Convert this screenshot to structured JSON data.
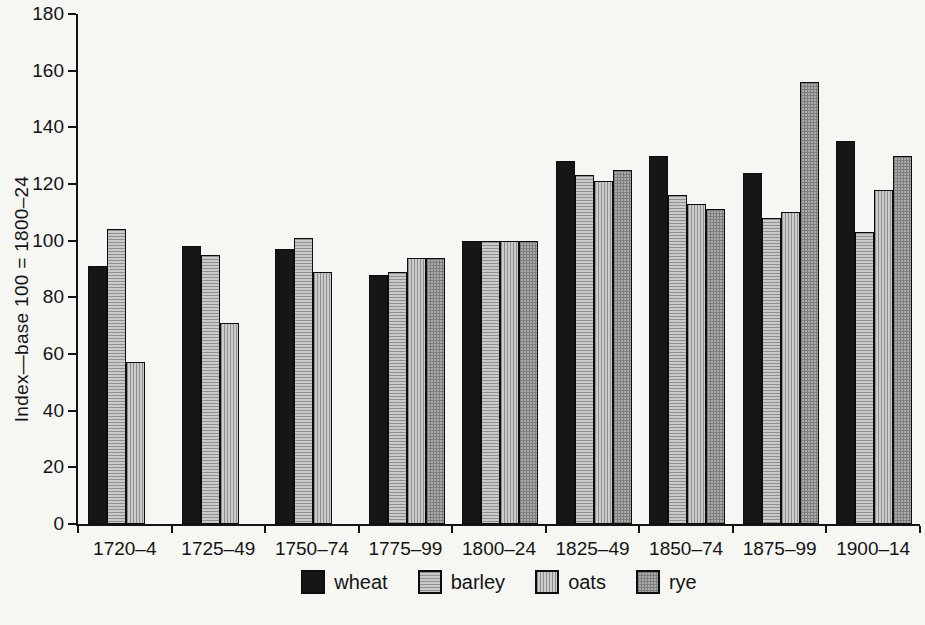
{
  "figure": {
    "background_color": "#f6f6f3",
    "axis_color": "#141414"
  },
  "chart_data": {
    "type": "bar",
    "title": "",
    "xlabel": "",
    "ylabel": "Index—base 100 = 1800–24",
    "ylim": [
      0,
      180
    ],
    "ytick_step": 20,
    "ytick_labels": [
      "0",
      "20",
      "40",
      "60",
      "80",
      "100",
      "120",
      "140",
      "160",
      "180"
    ],
    "grid": false,
    "legend_position": "bottom",
    "categories": [
      "1720–4",
      "1725–49",
      "1750–74",
      "1775–99",
      "1800–24",
      "1825–49",
      "1850–74",
      "1875–99",
      "1900–14"
    ],
    "series": [
      {
        "name": "wheat",
        "pattern": "solid",
        "color": "#161616",
        "line_color": "#161616",
        "values": [
          91,
          98,
          97,
          88,
          100,
          128,
          130,
          124,
          135
        ]
      },
      {
        "name": "barley",
        "pattern": "hlines",
        "color": "#c9c9c9",
        "line_color": "#909090",
        "values": [
          104,
          95,
          101,
          89,
          100,
          123,
          116,
          108,
          103
        ]
      },
      {
        "name": "oats",
        "pattern": "vlines",
        "color": "#cccccc",
        "line_color": "#8e8e8e",
        "values": [
          57,
          71,
          89,
          94,
          100,
          121,
          113,
          110,
          118
        ]
      },
      {
        "name": "rye",
        "pattern": "crosshatch",
        "color": "#ababab",
        "line_color": "#7c7c7c",
        "values": [
          null,
          null,
          null,
          94,
          100,
          125,
          111,
          156,
          130
        ]
      }
    ]
  }
}
